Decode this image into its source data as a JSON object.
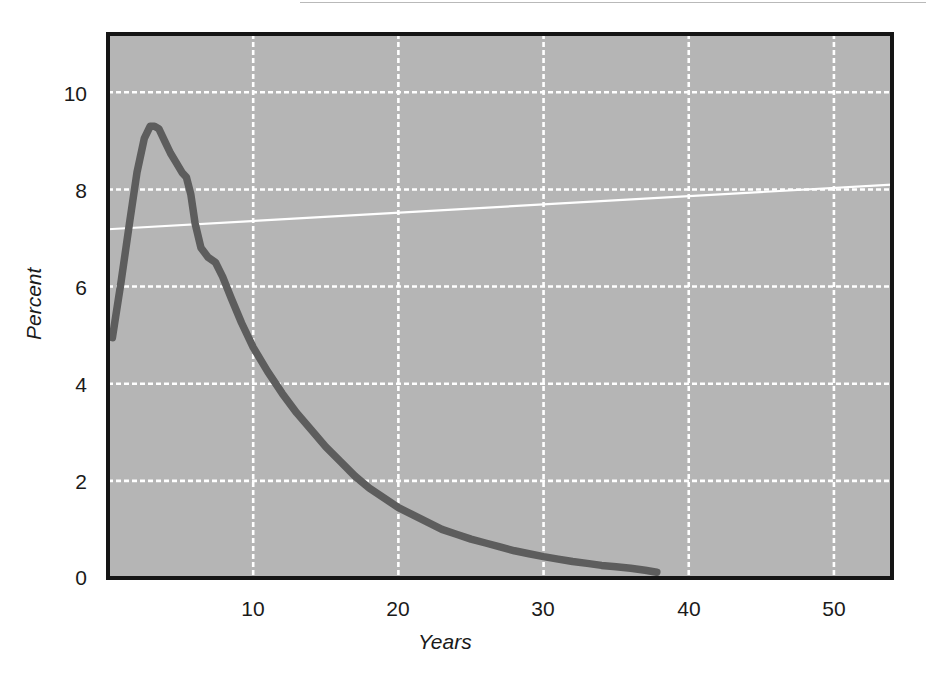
{
  "figure": {
    "background_color": "#ffffff",
    "plot_background_color": "#b5b5b5",
    "frame_color": "#151515",
    "gridline_color": "#ffffff",
    "curve_color": "#5d5d5d",
    "reference_line_color": "#ffffff"
  },
  "chart_data": {
    "type": "line",
    "title": "",
    "subtitle": "",
    "xlabel": "Years",
    "ylabel": "Percent",
    "xlim": [
      0,
      54
    ],
    "ylim": [
      0,
      11.2
    ],
    "xticks": [
      10,
      20,
      30,
      40,
      50
    ],
    "xtick_labels": [
      "10",
      "20",
      "30",
      "40",
      "50"
    ],
    "yticks": [
      0,
      2,
      4,
      6,
      8,
      10
    ],
    "ytick_labels": [
      "0",
      "2",
      "4",
      "6",
      "8",
      "10"
    ],
    "grid": true,
    "grid_style": "dotted-white",
    "legend": false,
    "legend_position": "none",
    "series": [
      {
        "name": "Percent by year",
        "style": "thick-dark-gray-line",
        "x": [
          0.3,
          0.9,
          1.5,
          2.0,
          2.5,
          2.9,
          3.2,
          3.5,
          3.9,
          4.3,
          4.7,
          5.1,
          5.4,
          5.7,
          6.0,
          6.4,
          6.9,
          7.4,
          7.9,
          8.5,
          9.2,
          10.0,
          11.0,
          12.0,
          13.0,
          14.0,
          15.0,
          16.0,
          17.0,
          18.0,
          19.0,
          20.0,
          21.0,
          22.0,
          23.0,
          24.0,
          25.0,
          26.0,
          27.0,
          28.0,
          29.0,
          30.0,
          31.0,
          32.0,
          33.0,
          34.0,
          35.0,
          36.0,
          37.0,
          37.8
        ],
        "y": [
          4.95,
          6.1,
          7.35,
          8.35,
          9.05,
          9.3,
          9.3,
          9.25,
          9.0,
          8.75,
          8.55,
          8.35,
          8.25,
          7.9,
          7.3,
          6.8,
          6.6,
          6.5,
          6.2,
          5.75,
          5.25,
          4.75,
          4.25,
          3.8,
          3.4,
          3.05,
          2.7,
          2.4,
          2.1,
          1.85,
          1.65,
          1.45,
          1.3,
          1.15,
          1.0,
          0.9,
          0.8,
          0.72,
          0.64,
          0.56,
          0.5,
          0.44,
          0.39,
          0.34,
          0.3,
          0.26,
          0.23,
          0.2,
          0.16,
          0.12
        ]
      },
      {
        "name": "Reference trend line",
        "style": "thin-white-line",
        "x": [
          0,
          54
        ],
        "y": [
          7.18,
          8.1
        ]
      }
    ]
  }
}
